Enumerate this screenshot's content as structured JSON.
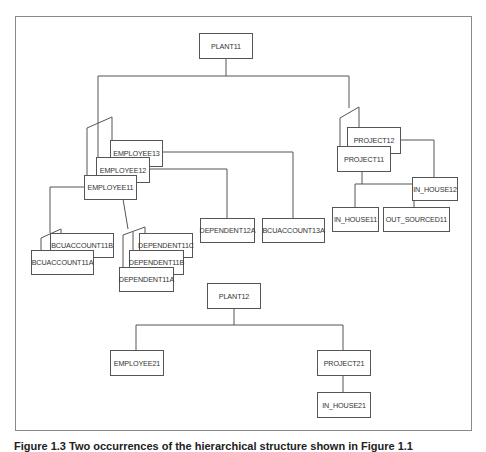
{
  "diagram": {
    "type": "hierarchical-database-occurrences",
    "occurrence1": {
      "root": "PLANT11",
      "employees": [
        "EMPLOYEE11",
        "EMPLOYEE12",
        "EMPLOYEE13"
      ],
      "employee11_children": {
        "bcuaccounts": [
          "BCUACCOUNT11A",
          "BCUACCOUNT11B"
        ],
        "dependents": [
          "DEPENDENT11A",
          "DEPENDENT11B",
          "DEPENDENT11C"
        ]
      },
      "employee12_children": [
        "DEPENDENT12A"
      ],
      "employee13_children": [
        "BCUACCOUNT13A"
      ],
      "projects": [
        "PROJECT11",
        "PROJECT12"
      ],
      "project11_children": [
        "IN_HOUSE11",
        "OUT_SOURCED11"
      ],
      "project12_children": [
        "IN_HOUSE12"
      ]
    },
    "occurrence2": {
      "root": "PLANT12",
      "employees": [
        "EMPLOYEE21"
      ],
      "projects": [
        "PROJECT21"
      ],
      "project21_children": [
        "IN_HOUSE21"
      ]
    }
  },
  "nodes": {
    "plant11": "PLANT11",
    "employee13": "EMPLOYEE13",
    "employee12": "EMPLOYEE12",
    "employee11": "EMPLOYEE11",
    "project12": "PROJECT12",
    "project11": "PROJECT11",
    "in_house12": "IN_HOUSE12",
    "in_house11": "IN_HOUSE11",
    "out_sourced11": "OUT_SOURCED11",
    "dependent12a": "DEPENDENT12A",
    "bcuaccount13a": "BCUACCOUNT13A",
    "bcuaccount11b": "BCUACCOUNT11B",
    "bcuaccount11a": "BCUACCOUNT11A",
    "dependent11c": "DEPENDENT11C",
    "dependent11b": "DEPENDENT11B",
    "dependent11a": "DEPENDENT11A",
    "plant12": "PLANT12",
    "employee21": "EMPLOYEE21",
    "project21": "PROJECT21",
    "in_house21": "IN_HOUSE21"
  },
  "caption": "Figure 1.3  Two occurrences of the hierarchical structure shown in Figure 1.1"
}
